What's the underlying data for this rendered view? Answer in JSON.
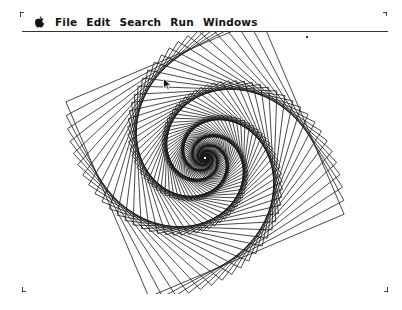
{
  "menubar": {
    "apple_icon": "apple-menu-icon",
    "items": [
      {
        "label": "File"
      },
      {
        "label": "Edit"
      },
      {
        "label": "Search"
      },
      {
        "label": "Run"
      },
      {
        "label": "Windows"
      }
    ]
  },
  "drawing": {
    "type": "rotating-square-spiral",
    "center": [
      205,
      158
    ],
    "start_half_diagonal": 150,
    "start_angle_deg": 202,
    "rotation_step_deg": 5,
    "scale_per_step": 0.968,
    "count": 130,
    "stroke_color": "#1a1a1a"
  },
  "cursor": {
    "icon": "arrow-pointer-icon",
    "x": 163,
    "y": 78
  },
  "colors": {
    "background": "#ffffff",
    "ink": "#111111"
  }
}
